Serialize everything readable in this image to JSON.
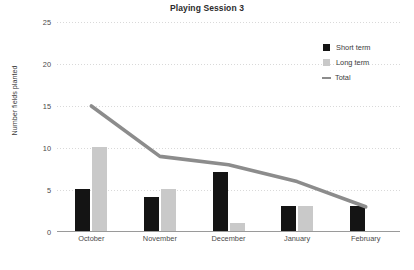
{
  "chart_data": {
    "type": "bar",
    "title": "Playing Session 3",
    "xlabel": "",
    "ylabel": "Number fields planted",
    "categories": [
      "October",
      "November",
      "December",
      "January",
      "February"
    ],
    "yticks": [
      0,
      5,
      10,
      15,
      20,
      25
    ],
    "ylim": [
      0,
      25
    ],
    "grid": true,
    "legend_position": "top-right",
    "series": [
      {
        "name": "Short term",
        "type": "bar",
        "color": "#141414",
        "values": [
          5,
          4,
          7,
          3,
          3
        ]
      },
      {
        "name": "Long term",
        "type": "bar",
        "color": "#c9c9c9",
        "values": [
          10,
          5,
          1,
          3,
          0
        ]
      },
      {
        "name": "Total",
        "type": "line",
        "color": "#8c8c8c",
        "values": [
          15,
          9,
          8,
          6,
          3
        ]
      }
    ]
  },
  "legend": {
    "items": [
      {
        "label": "Short term",
        "marker": "square-black-icon"
      },
      {
        "label": "Long term",
        "marker": "square-gray-icon"
      },
      {
        "label": "Total",
        "marker": "line-gray-icon"
      }
    ]
  }
}
